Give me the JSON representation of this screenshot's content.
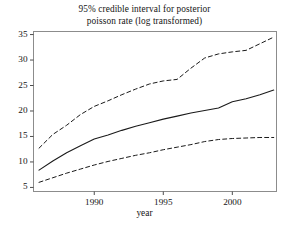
{
  "figure": {
    "title_line1": "95% credible interval for posterior",
    "title_line2": "poisson rate (log transformed)",
    "background": "#ffffff",
    "frame_color": "#808080",
    "line_color": "#1a1a1a"
  },
  "chart_data": {
    "type": "line",
    "title": "95% credible interval for posterior poisson rate (log transformed)",
    "xlabel": "year",
    "ylabel": "",
    "xlim": [
      1985.6,
      2003.2
    ],
    "ylim": [
      4.2,
      35.6
    ],
    "xticks": [
      1990,
      1995,
      2000
    ],
    "yticks": [
      5,
      10,
      15,
      20,
      25,
      30,
      35
    ],
    "xtick_labels": [
      "1990",
      "1995",
      "2000"
    ],
    "ytick_labels": [
      "5",
      "10",
      "15",
      "20",
      "25",
      "30",
      "35"
    ],
    "grid": false,
    "legend": "none",
    "x": [
      1986,
      1987,
      1988,
      1989,
      1990,
      1991,
      1992,
      1993,
      1994,
      1995,
      1996,
      1997,
      1998,
      1999,
      2000,
      2001,
      2002,
      2003
    ],
    "series": [
      {
        "name": "upper 97.5% credible bound",
        "style": "dashed",
        "values": [
          12.7,
          15.4,
          17.2,
          19.3,
          20.9,
          22.0,
          23.2,
          24.3,
          25.3,
          25.9,
          26.2,
          28.4,
          30.4,
          31.2,
          31.6,
          31.9,
          33.2,
          34.5
        ]
      },
      {
        "name": "posterior median rate",
        "style": "solid",
        "values": [
          8.4,
          10.2,
          11.8,
          13.2,
          14.5,
          15.3,
          16.2,
          17.0,
          17.7,
          18.4,
          19.0,
          19.6,
          20.1,
          20.6,
          21.8,
          22.4,
          23.2,
          24.1
        ]
      },
      {
        "name": "lower 2.5% credible bound",
        "style": "dashed",
        "values": [
          6.0,
          6.9,
          7.8,
          8.6,
          9.4,
          10.1,
          10.7,
          11.3,
          11.8,
          12.4,
          12.9,
          13.4,
          14.0,
          14.4,
          14.6,
          14.7,
          14.8,
          14.8
        ]
      }
    ]
  }
}
